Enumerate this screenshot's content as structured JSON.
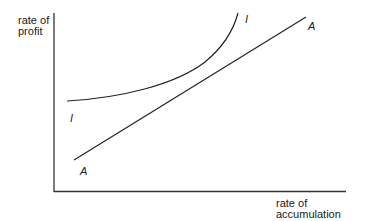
{
  "diagram": {
    "y_axis_label_line1": "rate of",
    "y_axis_label_line2": "profit",
    "x_axis_label_line1": "rate of",
    "x_axis_label_line2": "accumulation",
    "curves": [
      {
        "name": "I",
        "label_low": "I",
        "label_high": "I",
        "description": "convex curve rising steeply"
      },
      {
        "name": "A",
        "label_low": "A",
        "label_high": "A",
        "description": "upward sloping straight line"
      }
    ],
    "line_color": "#222222"
  }
}
